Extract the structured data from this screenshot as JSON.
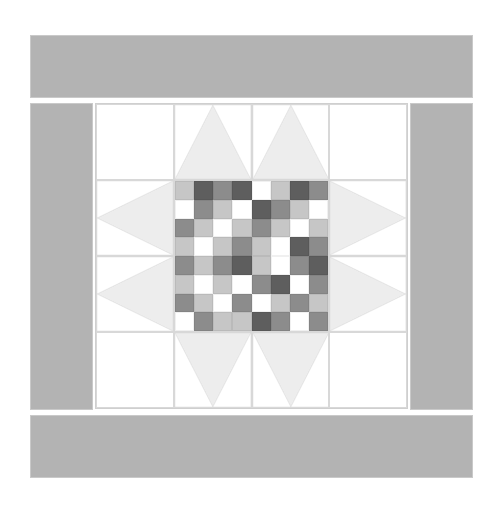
{
  "document": {
    "title": "Quilt Block Preview",
    "block_name": "Sawtooth Star with Checkerboard Center",
    "canvas_width": 501,
    "canvas_height": 511
  },
  "colors": {
    "background": "#ffffff",
    "sashing": "#b3b3b3",
    "sashing_outline": "#c9c9c9",
    "block_background": "#ffffff",
    "star_point": "#ededed",
    "seam_line": "#d8d8d8",
    "white": "#ffffff",
    "light_gray": "#c6c6c6",
    "medium_gray": "#8c8c8c",
    "dark_gray": "#5e5e5e"
  },
  "border": {
    "top_label": "top-sashing",
    "bottom_label": "bottom-sashing",
    "left_label": "left-sashing",
    "right_label": "right-sashing"
  },
  "star_block": {
    "rows": 4,
    "cols": 4,
    "units": [
      {
        "name": "corner-top-left",
        "type": "plain",
        "orientation": "none"
      },
      {
        "name": "star-point-top-left",
        "type": "flying-geese",
        "orientation": "up"
      },
      {
        "name": "star-point-top-right",
        "type": "flying-geese",
        "orientation": "up"
      },
      {
        "name": "corner-top-right",
        "type": "plain",
        "orientation": "none"
      },
      {
        "name": "star-point-left-top",
        "type": "flying-geese",
        "orientation": "left"
      },
      {
        "name": "center-patchwork",
        "type": "checkerboard",
        "orientation": "none"
      },
      {
        "name": "star-point-right-top",
        "type": "flying-geese",
        "orientation": "right"
      },
      {
        "name": "star-point-left-bottom",
        "type": "flying-geese",
        "orientation": "left"
      },
      {
        "name": "star-point-right-bottom",
        "type": "flying-geese",
        "orientation": "right"
      },
      {
        "name": "corner-bottom-left",
        "type": "plain",
        "orientation": "none"
      },
      {
        "name": "star-point-bottom-left",
        "type": "flying-geese",
        "orientation": "down"
      },
      {
        "name": "star-point-bottom-right",
        "type": "flying-geese",
        "orientation": "down"
      },
      {
        "name": "corner-bottom-right",
        "type": "plain",
        "orientation": "none"
      }
    ]
  },
  "chart_data": {
    "type": "heatmap",
    "xlabel": "",
    "ylabel": "",
    "rows": 8,
    "cols": 8,
    "palette": {
      "W": "#ffffff",
      "L": "#c6c6c6",
      "M": "#8c8c8c",
      "D": "#5e5e5e"
    },
    "value_scale": {
      "W": 0,
      "L": 1,
      "M": 2,
      "D": 3
    },
    "grid": [
      [
        "L",
        "D",
        "M",
        "D",
        "W",
        "L",
        "D",
        "M"
      ],
      [
        "W",
        "M",
        "L",
        "W",
        "D",
        "M",
        "L",
        "W"
      ],
      [
        "M",
        "L",
        "W",
        "L",
        "M",
        "L",
        "W",
        "L"
      ],
      [
        "L",
        "W",
        "L",
        "M",
        "L",
        "W",
        "D",
        "M"
      ],
      [
        "M",
        "L",
        "M",
        "D",
        "L",
        "W",
        "M",
        "D"
      ],
      [
        "L",
        "W",
        "L",
        "W",
        "M",
        "D",
        "W",
        "M"
      ],
      [
        "M",
        "L",
        "W",
        "M",
        "W",
        "L",
        "M",
        "L"
      ],
      [
        "W",
        "M",
        "L",
        "L",
        "D",
        "M",
        "W",
        "M"
      ]
    ]
  }
}
